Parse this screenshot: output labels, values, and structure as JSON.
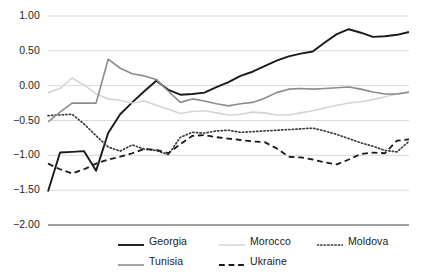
{
  "chart_data": {
    "type": "line",
    "title": "",
    "xlabel": "",
    "ylabel": "",
    "ylim": [
      -2.0,
      1.0
    ],
    "ytick_labels": [
      "1.00",
      "0.50",
      "0.00",
      "-0.50",
      "-1.00",
      "-1.50",
      "-2.00"
    ],
    "ytick_values": [
      1.0,
      0.5,
      0.0,
      -0.5,
      -1.0,
      -1.5,
      -2.0
    ],
    "xtick_labels": [],
    "grid": "horizontal",
    "legend_position": "bottom",
    "x": [
      1,
      2,
      3,
      4,
      5,
      6,
      7,
      8,
      9,
      10,
      11,
      12,
      13,
      14,
      15,
      16,
      17,
      18,
      19,
      20,
      21,
      22,
      23,
      24,
      25,
      26,
      27,
      28,
      29,
      30,
      31
    ],
    "series": [
      {
        "name": "Georgia",
        "style": "solid",
        "color": "#1a1a1a",
        "width": 1.9,
        "values": [
          -1.52,
          -0.96,
          -0.95,
          -0.94,
          -1.22,
          -0.68,
          -0.41,
          -0.24,
          -0.08,
          0.07,
          -0.06,
          -0.13,
          -0.12,
          -0.1,
          -0.02,
          0.05,
          0.14,
          0.2,
          0.28,
          0.36,
          0.42,
          0.46,
          0.49,
          0.62,
          0.74,
          0.81,
          0.76,
          0.7,
          0.71,
          0.73,
          0.77
        ]
      },
      {
        "name": "Morocco",
        "style": "solid",
        "color": "#d4d4d4",
        "width": 1.6,
        "values": [
          -0.1,
          -0.04,
          0.11,
          0.01,
          -0.12,
          -0.19,
          -0.21,
          -0.25,
          -0.22,
          -0.28,
          -0.34,
          -0.4,
          -0.37,
          -0.36,
          -0.39,
          -0.42,
          -0.41,
          -0.38,
          -0.39,
          -0.42,
          -0.42,
          -0.39,
          -0.36,
          -0.32,
          -0.28,
          -0.25,
          -0.23,
          -0.2,
          -0.16,
          -0.12,
          -0.1
        ]
      },
      {
        "name": "Moldova",
        "style": "dotted",
        "color": "#3d3d3d",
        "width": 1.7,
        "values": [
          -0.43,
          -0.42,
          -0.41,
          -0.55,
          -0.72,
          -0.88,
          -0.94,
          -0.85,
          -0.91,
          -0.93,
          -0.99,
          -0.74,
          -0.67,
          -0.68,
          -0.65,
          -0.64,
          -0.67,
          -0.66,
          -0.65,
          -0.64,
          -0.63,
          -0.62,
          -0.61,
          -0.65,
          -0.7,
          -0.76,
          -0.82,
          -0.87,
          -0.93,
          -0.95,
          -0.8
        ]
      },
      {
        "name": "Tunisia",
        "style": "solid",
        "color": "#8c8c8c",
        "width": 1.6,
        "values": [
          -0.52,
          -0.38,
          -0.25,
          -0.25,
          -0.25,
          0.38,
          0.25,
          0.17,
          0.14,
          0.09,
          -0.08,
          -0.24,
          -0.19,
          -0.22,
          -0.26,
          -0.29,
          -0.26,
          -0.24,
          -0.18,
          -0.1,
          -0.05,
          -0.04,
          -0.05,
          -0.04,
          -0.03,
          -0.02,
          -0.05,
          -0.09,
          -0.12,
          -0.12,
          -0.09
        ]
      },
      {
        "name": "Ukraine",
        "style": "dashed",
        "color": "#1a1a1a",
        "width": 1.8,
        "values": [
          -1.12,
          -1.2,
          -1.26,
          -1.2,
          -1.12,
          -1.06,
          -1.02,
          -0.97,
          -0.91,
          -0.92,
          -0.97,
          -0.84,
          -0.72,
          -0.71,
          -0.74,
          -0.76,
          -0.78,
          -0.8,
          -0.81,
          -0.9,
          -1.02,
          -1.03,
          -1.06,
          -1.1,
          -1.13,
          -1.06,
          -0.98,
          -0.96,
          -0.97,
          -0.79,
          -0.77
        ]
      }
    ]
  },
  "legend": {
    "rows": [
      [
        {
          "label": "Georgia",
          "key": "georgia"
        },
        {
          "label": "Morocco",
          "key": "morocco"
        },
        {
          "label": "Moldova",
          "key": "moldova"
        }
      ],
      [
        {
          "label": "Tunisia",
          "key": "tunisia"
        },
        {
          "label": "Ukraine",
          "key": "ukraine"
        }
      ]
    ]
  },
  "axis": {
    "baseline_color": "#808080",
    "gridline_color": "#d9d9d9"
  }
}
